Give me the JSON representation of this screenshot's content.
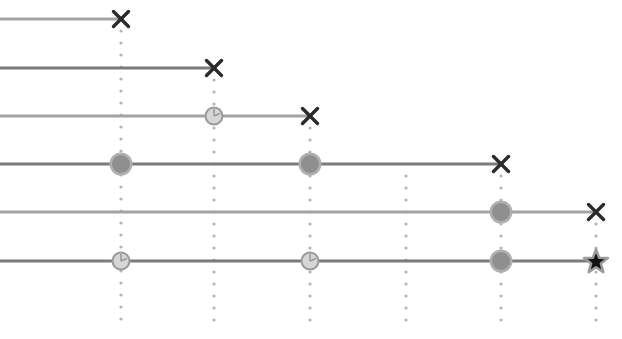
{
  "diagram": {
    "type": "timeline-swimlanes",
    "width": 622,
    "height": 339,
    "colors": {
      "line_light": "#a3a3a3",
      "line_dark": "#7b7b7b",
      "dots": "#b5b5b5",
      "x_mark": "#2b2b2b",
      "filled_circle_fill": "#8f8f8f",
      "filled_circle_ring": "#b0b0b0",
      "clock_fill": "#d6d6d6",
      "clock_stroke": "#9a9a9a",
      "star_fill": "#111111",
      "star_halo": "#9a9a9a"
    },
    "columns": [
      {
        "x": 121,
        "dots_from_y": 19
      },
      {
        "x": 214,
        "dots_from_y": 68
      },
      {
        "x": 310,
        "dots_from_y": 116
      },
      {
        "x": 406,
        "dots_from_y": 164
      },
      {
        "x": 501,
        "dots_from_y": 164
      },
      {
        "x": 596,
        "dots_from_y": 212
      }
    ],
    "dots_end_y": 321,
    "rows": [
      {
        "y": 19,
        "tone": "light",
        "end_x": 121,
        "markers": [
          {
            "x": 121,
            "kind": "x-mark"
          }
        ]
      },
      {
        "y": 68,
        "tone": "dark",
        "end_x": 214,
        "markers": [
          {
            "x": 214,
            "kind": "x-mark"
          }
        ]
      },
      {
        "y": 116,
        "tone": "light",
        "end_x": 310,
        "markers": [
          {
            "x": 214,
            "kind": "clock"
          },
          {
            "x": 310,
            "kind": "x-mark"
          }
        ]
      },
      {
        "y": 164,
        "tone": "dark",
        "end_x": 501,
        "markers": [
          {
            "x": 121,
            "kind": "filled-circle"
          },
          {
            "x": 310,
            "kind": "filled-circle"
          },
          {
            "x": 501,
            "kind": "x-mark"
          }
        ]
      },
      {
        "y": 212,
        "tone": "light",
        "end_x": 596,
        "markers": [
          {
            "x": 501,
            "kind": "filled-circle"
          },
          {
            "x": 596,
            "kind": "x-mark"
          }
        ]
      },
      {
        "y": 261,
        "tone": "dark",
        "end_x": 596,
        "markers": [
          {
            "x": 121,
            "kind": "clock"
          },
          {
            "x": 310,
            "kind": "clock"
          },
          {
            "x": 501,
            "kind": "filled-circle"
          },
          {
            "x": 596,
            "kind": "star"
          }
        ]
      }
    ]
  }
}
